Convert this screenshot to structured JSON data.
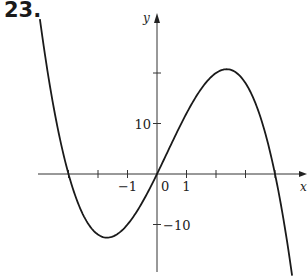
{
  "problem": {
    "number": "23."
  },
  "chart_data": {
    "type": "line",
    "title": "",
    "xlabel": "x",
    "ylabel": "y",
    "x_ticks": [
      -3,
      -2,
      -1,
      0,
      1,
      2,
      3,
      4
    ],
    "x_tick_labels": [
      {
        "value": -1,
        "label": "−1"
      },
      {
        "value": 0,
        "label": "0"
      },
      {
        "value": 1,
        "label": "1"
      }
    ],
    "y_ticks": [
      -10,
      10,
      20
    ],
    "y_tick_labels": [
      {
        "value": 10,
        "label": "10"
      },
      {
        "value": -10,
        "label": "−10"
      }
    ],
    "xlim": [
      -4.0,
      5.2
    ],
    "ylim": [
      -20.5,
      34
    ],
    "grid": false,
    "legend": null,
    "series": [
      {
        "name": "f(x)",
        "description": "cubic with zeros at x = -3, 0, 4; local min about (-1.7, -12.6); local max about (2.4, 20.7)",
        "x": [
          -3.97,
          -3.5,
          -3,
          -2.5,
          -2,
          -1.69,
          -1.5,
          -1,
          -0.5,
          0,
          0.5,
          1,
          1.5,
          2,
          2.36,
          2.5,
          3,
          3.5,
          4,
          4.3,
          4.58
        ],
        "y": [
          30.8,
          14.9,
          0,
          -8.1,
          -12.0,
          -12.6,
          -12.4,
          -10.0,
          -5.6,
          0,
          5.9,
          12.0,
          16.9,
          20.0,
          20.7,
          20.6,
          18.0,
          11.4,
          0,
          -8.0,
          -20.1
        ]
      }
    ],
    "critical_points": {
      "local_min": [
        -1.69,
        -12.6
      ],
      "local_max": [
        2.36,
        20.75
      ],
      "zeros": [
        -3,
        0,
        4
      ]
    }
  }
}
